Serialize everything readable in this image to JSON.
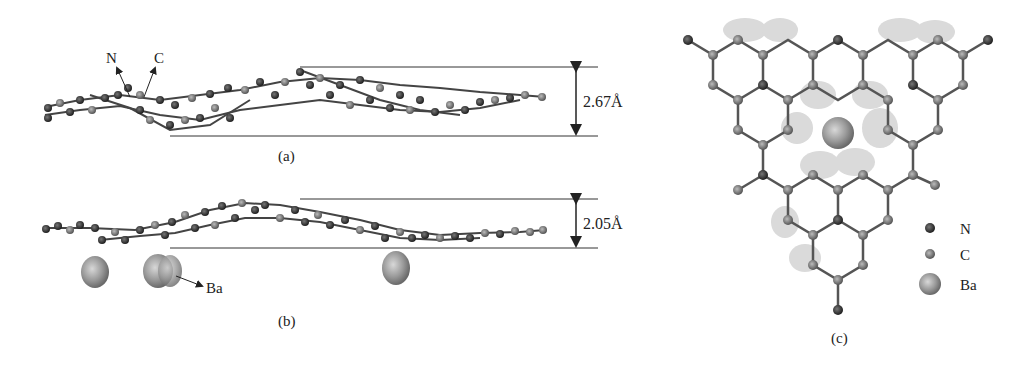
{
  "panels": {
    "a": {
      "caption": "(a)",
      "labels": {
        "n": "N",
        "c": "C"
      },
      "distance": "2.67Å"
    },
    "b": {
      "caption": "(b)",
      "labels": {
        "ba": "Ba"
      },
      "distance": "2.05Å"
    },
    "c": {
      "caption": "(c)",
      "legend": [
        {
          "label": "N",
          "color": "#333333"
        },
        {
          "label": "C",
          "color": "#707070"
        },
        {
          "label": "Ba",
          "color": "#9a9a9a"
        }
      ]
    }
  },
  "colors": {
    "nitrogen": "#2e2e2e",
    "carbon": "#6e6e6e",
    "barium": "#9c9c9c",
    "density": "#cfcfcf",
    "line": "#333333"
  }
}
